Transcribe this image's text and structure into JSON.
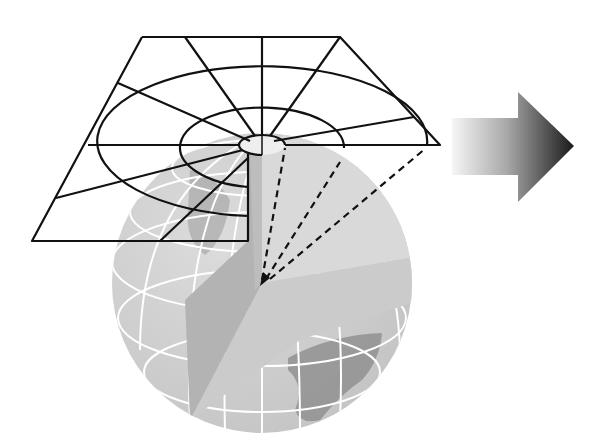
{
  "figure": {
    "title": "Azimuthal (planar) map projection",
    "elements": {
      "projection_plane": "Planar grid with concentric circles (parallels) and radial lines (meridians)",
      "globe": "Grey globe with white graticule and a cut-away wedge showing the center",
      "projection_rays": "Dashed lines from the globe center to the plane",
      "arrow": "Right-pointing gradient arrow"
    },
    "colors": {
      "line": "#111111",
      "globe_light": "#d6d6d6",
      "globe_mid": "#c4c4c4",
      "globe_dark": "#a9a9a9",
      "graticule": "#ffffff",
      "arrow_start": "#f4f4f4",
      "arrow_end": "#1a1a1a"
    }
  }
}
